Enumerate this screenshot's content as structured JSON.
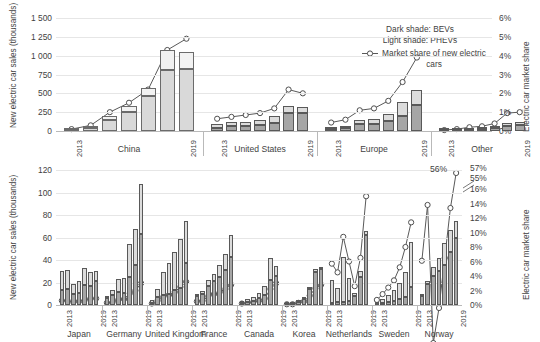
{
  "legend": {
    "dark_shade": "Dark shade: BEVs",
    "light_shade": "Light shade: PHEVs",
    "market_share_line": "Market share of new electric cars"
  },
  "top_chart": {
    "ylabel": "New electric car sales (thousands)",
    "y2label": "Electric car market share",
    "yticks": [
      "1 500",
      "1 250",
      "1 000",
      "750",
      "500",
      "250",
      "0"
    ],
    "y2ticks": [
      "6%",
      "5%",
      "4%",
      "3%",
      "2%",
      "1%",
      "0%"
    ],
    "start_year": "2013",
    "end_year": "2019",
    "groups": [
      "China",
      "United States",
      "Europe",
      "Other"
    ]
  },
  "bottom_chart": {
    "ylabel": "New electric car sales (thousands)",
    "y2label": "Electric car market share",
    "yticks": [
      "120",
      "100",
      "80",
      "60",
      "40",
      "20",
      "0"
    ],
    "y2ticks": [
      "57%",
      "55%",
      "16%",
      "14%",
      "12%",
      "10%",
      "8%",
      "6%",
      "4%",
      "2%",
      "0%"
    ],
    "start_year": "2013",
    "end_year": "2019",
    "groups": [
      "Japan",
      "Germany",
      "United Kingdom",
      "France",
      "Canada",
      "Korea",
      "Netherlands",
      "Sweden",
      "Norway"
    ],
    "annotation": "56%"
  },
  "colors": {
    "bev_dark": "#a6a6a6",
    "phev_light": "#dcdcdc",
    "bev_light_group": "#d9d9d9",
    "phev_light_group": "#f2f2f2",
    "line": "#595959",
    "grid": "#e6e6e6",
    "text": "#3f3f3f"
  },
  "chart_data": [
    {
      "type": "bar",
      "id": "top",
      "title": "",
      "xlabel": "",
      "ylabel": "New electric car sales (thousands)",
      "y2label": "Electric car market share",
      "ylim": [
        0,
        1500
      ],
      "y2lim": [
        0,
        6
      ],
      "grid": true,
      "years": [
        "2013",
        "2014",
        "2015",
        "2016",
        "2017",
        "2018",
        "2019"
      ],
      "legend": [
        "Dark shade: BEVs",
        "Light shade: PHEVs",
        "Market share of new electric cars"
      ],
      "groups": [
        {
          "name": "China",
          "shade": "light",
          "bev": [
            8,
            45,
            145,
            255,
            465,
            810,
            830
          ],
          "phev": [
            7,
            17,
            55,
            75,
            110,
            265,
            220
          ],
          "market_share": [
            0.1,
            0.3,
            1.0,
            1.5,
            2.2,
            4.3,
            4.9
          ]
        },
        {
          "name": "United States",
          "shade": "dark",
          "bev": [
            47,
            63,
            65,
            85,
            105,
            240,
            245
          ],
          "phev": [
            45,
            55,
            50,
            60,
            90,
            95,
            80
          ],
          "market_share": [
            0.65,
            0.75,
            0.85,
            0.95,
            1.2,
            2.2,
            2.0
          ]
        },
        {
          "name": "Europe",
          "shade": "dark",
          "bev": [
            30,
            45,
            90,
            95,
            130,
            200,
            350
          ],
          "phev": [
            20,
            25,
            55,
            60,
            90,
            190,
            190
          ]
        },
        {
          "name": "Other",
          "shade": "dark",
          "bev": [
            5,
            10,
            18,
            22,
            35,
            70,
            80
          ],
          "phev": [
            3,
            6,
            10,
            12,
            20,
            35,
            35
          ],
          "market_share": [
            0.05,
            0.1,
            0.2,
            0.25,
            0.4,
            0.95,
            1.0
          ]
        }
      ]
    },
    {
      "type": "bar",
      "id": "bottom",
      "title": "",
      "xlabel": "",
      "ylabel": "New electric car sales (thousands)",
      "y2label": "Electric car market share",
      "ylim": [
        0,
        120
      ],
      "y2lim": [
        0,
        16
      ],
      "y2_break": true,
      "grid": true,
      "years": [
        "2013",
        "2014",
        "2015",
        "2016",
        "2017",
        "2018",
        "2019"
      ],
      "groups": [
        {
          "name": "Japan",
          "bev": [
            13,
            14,
            10,
            11,
            18,
            17,
            21
          ],
          "phev": [
            17,
            17,
            9,
            10,
            15,
            12,
            9
          ],
          "market_share": [
            0.6,
            0.6,
            0.4,
            0.5,
            0.7,
            0.9,
            0.9
          ]
        },
        {
          "name": "Germany",
          "bev": [
            6,
            9,
            12,
            11,
            25,
            36,
            63
          ],
          "phev": [
            2,
            4,
            11,
            13,
            29,
            32,
            45
          ],
          "market_share": [
            0.3,
            0.4,
            0.7,
            0.8,
            1.6,
            2.0,
            3.0
          ]
        },
        {
          "name": "United Kingdom",
          "bev": [
            2,
            7,
            9,
            10,
            13,
            15,
            37
          ],
          "phev": [
            2,
            7,
            20,
            27,
            34,
            44,
            38
          ],
          "market_share": [
            0.2,
            0.6,
            1.1,
            1.4,
            1.8,
            2.5,
            3.2
          ]
        },
        {
          "name": "France",
          "bev": [
            8,
            10,
            17,
            21,
            25,
            31,
            43
          ],
          "phev": [
            1,
            2,
            5,
            7,
            11,
            14,
            19
          ],
          "market_share": [
            0.5,
            0.6,
            1.2,
            1.5,
            1.8,
            2.2,
            2.8
          ]
        },
        {
          "name": "Canada",
          "bev": [
            2,
            3,
            4,
            6,
            9,
            22,
            26
          ],
          "phev": [
            1,
            2,
            3,
            5,
            8,
            20,
            9
          ],
          "market_share": [
            0.2,
            0.3,
            0.4,
            0.6,
            0.9,
            2.2,
            3.0
          ]
        },
        {
          "name": "Korea",
          "bev": [
            1,
            1,
            3,
            5,
            14,
            29,
            32
          ],
          "phev": [
            0,
            0,
            1,
            1,
            2,
            3,
            2
          ],
          "market_share": [
            0.1,
            0.1,
            0.3,
            0.5,
            1.3,
            2.3,
            2.8
          ]
        },
        {
          "name": "Netherlands",
          "bev": [
            2,
            3,
            3,
            4,
            8,
            25,
            62
          ],
          "phev": [
            20,
            12,
            40,
            20,
            3,
            5,
            4
          ],
          "market_share": [
            5.7,
            4.5,
            9.4,
            6.0,
            2.6,
            6.5,
            15.0
          ]
        },
        {
          "name": "Sweden",
          "bev": [
            1,
            2,
            3,
            4,
            5,
            7,
            16
          ],
          "phev": [
            1,
            3,
            6,
            9,
            15,
            22,
            40
          ],
          "market_share": [
            0.7,
            1.5,
            2.4,
            3.4,
            5.2,
            8.0,
            11.4
          ]
        },
        {
          "name": "Norway",
          "bev": [
            8,
            19,
            26,
            30,
            36,
            47,
            60
          ],
          "phev": [
            1,
            2,
            8,
            12,
            19,
            20,
            15
          ],
          "market_share": [
            6.1,
            13.8,
            22.0,
            29.0,
            39.0,
            49.0,
            56.0
          ]
        }
      ]
    }
  ]
}
